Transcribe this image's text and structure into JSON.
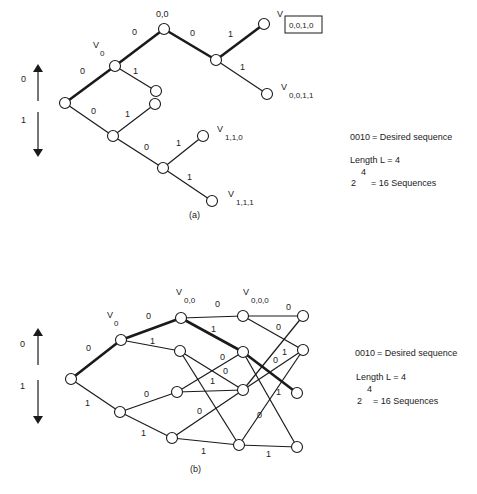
{
  "diagram_a": {
    "caption": "(a)",
    "direction_legend": {
      "up_label": "0",
      "down_label": "1"
    },
    "nodes": {
      "root_label": "0,0",
      "v0_label": "V",
      "v0_sub": "0",
      "v0010_label": "V",
      "v0010_boxed": "0,0,1,0",
      "v0011_label": "V",
      "v0011_sub": "0,0,1,1",
      "v110_label": "V",
      "v110_sub": "1,1,0",
      "v111_label": "V",
      "v111_sub": "1,1,1"
    },
    "edge_labels": [
      "0",
      "0",
      "1",
      "0",
      "1",
      "1",
      "0",
      "1",
      "0",
      "1"
    ],
    "info": {
      "sequence": "0010",
      "sequence_desc": "= Desired sequence",
      "length": "Length L = 4",
      "base": "2",
      "exponent": "4",
      "count": "= 16 Sequences"
    }
  },
  "diagram_b": {
    "caption": "(b)",
    "direction_legend": {
      "up_label": "0",
      "down_label": "1"
    },
    "nodes": {
      "v0_label": "V",
      "v0_sub": "0",
      "v00_label": "V",
      "v00_sub": "0,0",
      "v000_label": "V",
      "v000_sub": "0,0,0"
    },
    "edge_labels": [
      "0",
      "1",
      "0",
      "1",
      "0",
      "1",
      "0",
      "1",
      "0",
      "0",
      "1",
      "0",
      "1",
      "0",
      "0",
      "1",
      "0",
      "1"
    ],
    "info": {
      "sequence": "0010",
      "sequence_desc": "= Desired sequence",
      "length": "Length L = 4",
      "base": "2",
      "exponent": "4",
      "count": "= 16 Sequences"
    }
  },
  "colors": {
    "line": "#1a1a1a",
    "node_fill": "#ffffff",
    "text": "#222222"
  }
}
